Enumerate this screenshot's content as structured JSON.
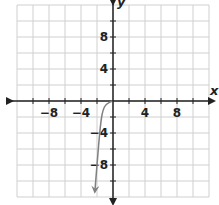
{
  "chart_data": {
    "type": "line",
    "title": "",
    "xlabel": "x",
    "ylabel": "y",
    "xlim": [
      -12,
      12
    ],
    "ylim": [
      -12,
      12
    ],
    "grid": true,
    "grid_step": 2,
    "x_ticks": [
      "-8",
      "-4",
      "4",
      "8"
    ],
    "y_ticks": [
      "8",
      "4",
      "-4",
      "-8"
    ],
    "series": [
      {
        "name": "curve",
        "color": "#808080",
        "arrow_end": true,
        "points": [
          [
            -0.1,
            0
          ],
          [
            -0.9,
            -0.4
          ],
          [
            -1.25,
            -1.1
          ],
          [
            -1.5,
            -2.4
          ],
          [
            -1.75,
            -4.9
          ],
          [
            -2.0,
            -8.0
          ],
          [
            -2.25,
            -11.1
          ]
        ]
      }
    ]
  },
  "labels": {
    "x_axis": "x",
    "y_axis": "y",
    "xt0": "−8",
    "xt1": "−4",
    "xt2": "4",
    "xt3": "8",
    "yt0": "8",
    "yt1": "4",
    "yt2": "−4",
    "yt3": "−8"
  }
}
